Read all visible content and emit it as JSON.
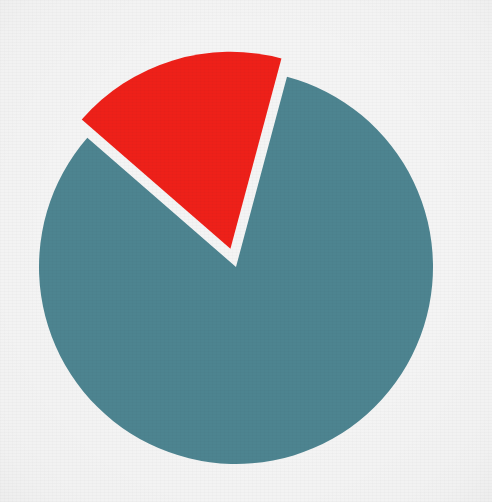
{
  "chart_data": {
    "type": "pie",
    "title": "",
    "subtitle": "",
    "xlabel": "",
    "ylabel": "",
    "grid": false,
    "legend_position": "none",
    "labels_shown": false,
    "categories": [
      "Majority",
      "Minority"
    ],
    "values": [
      82,
      18
    ],
    "units": "percent",
    "total": 100,
    "start_angle_deg": 75,
    "direction": "counterclockwise",
    "slices": [
      {
        "name": "Majority",
        "value": 82,
        "percent": "82%",
        "angle_deg": 296,
        "color": "#4d8490",
        "exploded": false,
        "offset_px": 0
      },
      {
        "name": "Minority",
        "value": 18,
        "percent": "18%",
        "angle_deg": 64,
        "color": "#ee2019",
        "exploded": true,
        "offset_px": 19
      }
    ],
    "colors": {
      "teal": "#4d8490",
      "red": "#ee2019",
      "background": "#f4f4f4"
    },
    "geometry": {
      "center_x": 236,
      "center_y": 267,
      "radius": 197,
      "canvas_width": 492,
      "canvas_height": 502
    }
  },
  "figure": {
    "caption": ""
  }
}
